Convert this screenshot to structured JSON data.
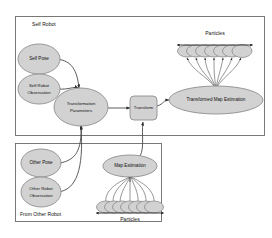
{
  "figure": {
    "type": "flow-diagram",
    "title": "",
    "background_color": "#ffffff",
    "shape_fill": "#d2d2d2",
    "shape_stroke": "#8e8e8e",
    "edge_color": "#4a4a4a"
  },
  "groups": [
    {
      "id": "self-robot",
      "label": "Self Robot",
      "label_position": "top-left"
    },
    {
      "id": "from-other-robot",
      "label": "From Other Robot",
      "label_position": "bottom-left"
    }
  ],
  "nodes": [
    {
      "id": "self-pose",
      "label": "Self Pose",
      "shape": "ellipse",
      "group": "self-robot"
    },
    {
      "id": "self-robot-observation",
      "label_line1": "Self Robot",
      "label_line2": "Observation",
      "shape": "ellipse",
      "group": "self-robot"
    },
    {
      "id": "transformation-parameters",
      "label_line1": "Transformation",
      "label_line2": "Parameters",
      "shape": "ellipse",
      "group": "self-robot"
    },
    {
      "id": "transform",
      "label": "Transform",
      "shape": "rounded-rect",
      "group": "self-robot"
    },
    {
      "id": "transformed-map-estimation",
      "label": "Transformed Map Estimation",
      "shape": "ellipse",
      "group": "self-robot"
    },
    {
      "id": "other-pose",
      "label": "Other Pose",
      "shape": "ellipse",
      "group": "from-other-robot"
    },
    {
      "id": "other-robot-observation",
      "label_line1": "Other Robot",
      "label_line2": "Observation",
      "shape": "ellipse",
      "group": "from-other-robot"
    },
    {
      "id": "map-estimation",
      "label": "Map Estimation",
      "shape": "ellipse",
      "group": "from-other-robot"
    }
  ],
  "particle_clusters": [
    {
      "id": "particles-top",
      "label": "Particles",
      "label_position": "above",
      "count": 7,
      "attached_to": "transformed-map-estimation",
      "spread_bar": true
    },
    {
      "id": "particles-bottom",
      "label": "Particles",
      "label_position": "below",
      "count": 7,
      "attached_to": "map-estimation",
      "spread_bar": true
    }
  ],
  "edges": [
    {
      "from": "self-pose",
      "to": "transformation-parameters"
    },
    {
      "from": "self-robot-observation",
      "to": "transformation-parameters"
    },
    {
      "from": "other-pose",
      "to": "transformation-parameters"
    },
    {
      "from": "other-robot-observation",
      "to": "transformation-parameters"
    },
    {
      "from": "transformation-parameters",
      "to": "transform"
    },
    {
      "from": "map-estimation",
      "to": "transform"
    },
    {
      "from": "transform",
      "to": "transformed-map-estimation"
    },
    {
      "from": "transformed-map-estimation",
      "to": "particles-top"
    },
    {
      "from": "particles-bottom",
      "to": "map-estimation"
    }
  ]
}
